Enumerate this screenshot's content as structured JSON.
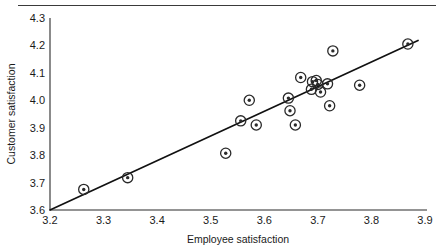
{
  "chart_data": {
    "type": "scatter",
    "title": "",
    "xlabel": "Employee satisfaction",
    "ylabel": "Customer satisfaction",
    "xlim": [
      3.2,
      3.9
    ],
    "ylim": [
      3.6,
      4.3
    ],
    "xticks": [
      "3.2",
      "3.3",
      "3.4",
      "3.5",
      "3.6",
      "3.7",
      "3.8",
      "3.9"
    ],
    "yticks": [
      "3.6",
      "3.7",
      "3.8",
      "3.9",
      "4.0",
      "4.1",
      "4.2",
      "4.3"
    ],
    "xtick_values": [
      3.2,
      3.3,
      3.4,
      3.5,
      3.6,
      3.7,
      3.8,
      3.9
    ],
    "ytick_values": [
      3.6,
      3.7,
      3.8,
      3.9,
      4.0,
      4.1,
      4.2,
      4.3
    ],
    "grid": false,
    "legend": false,
    "marker": "bullseye-circle",
    "series": [
      {
        "name": "observations",
        "points": [
          [
            3.263,
            3.675
          ],
          [
            3.345,
            3.718
          ],
          [
            3.528,
            3.807
          ],
          [
            3.556,
            3.925
          ],
          [
            3.572,
            4.0
          ],
          [
            3.585,
            3.91
          ],
          [
            3.645,
            4.008
          ],
          [
            3.648,
            3.962
          ],
          [
            3.658,
            3.91
          ],
          [
            3.668,
            4.083
          ],
          [
            3.688,
            4.04
          ],
          [
            3.69,
            4.068
          ],
          [
            3.697,
            4.072
          ],
          [
            3.7,
            4.058
          ],
          [
            3.705,
            4.03
          ],
          [
            3.718,
            4.06
          ],
          [
            3.722,
            3.98
          ],
          [
            3.728,
            4.18
          ],
          [
            3.778,
            4.055
          ],
          [
            3.868,
            4.205
          ]
        ]
      }
    ],
    "fit_line": {
      "name": "regression-line",
      "x_start": 3.2,
      "y_start": 3.6,
      "x_end": 3.887,
      "y_end": 4.218
    }
  },
  "axes": {
    "x_title": "Employee satisfaction",
    "y_title": "Customer satisfaction"
  }
}
